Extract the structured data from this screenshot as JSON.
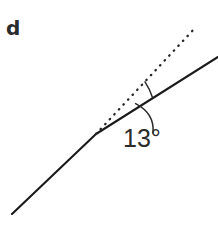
{
  "figure": {
    "panel_label": "d",
    "angle_label": "13°",
    "background_color": "#ffffff",
    "stroke_color": "#1a1a1a",
    "dotted_color": "#262626",
    "arc_color": "#2b2b2b",
    "label_color": "#2b2b2b"
  },
  "chart_data": {
    "type": "diagram",
    "title": "",
    "subtitle": "",
    "xlabel": "",
    "ylabel": "",
    "annotations": [
      {
        "name": "panel-letter",
        "text": "d",
        "x": 6,
        "y": 18
      },
      {
        "name": "angle-value",
        "text": "13°",
        "x": 123,
        "y": 126
      }
    ],
    "series": [
      {
        "name": "solid-polyline",
        "style": "solid",
        "points": [
          [
            12,
            214
          ],
          [
            96,
            134
          ],
          [
            218,
            57
          ]
        ]
      },
      {
        "name": "dotted-reference-line",
        "style": "dotted",
        "points": [
          [
            96,
            134
          ],
          [
            196,
            27
          ]
        ]
      }
    ],
    "angle_marks": [
      {
        "name": "angle-arc-small",
        "vertex": [
          96,
          134
        ],
        "value_deg": 13,
        "arc_from": [
          145,
          82
        ],
        "arc_to": [
          152,
          97
        ]
      },
      {
        "name": "angle-leader-arc",
        "arc_from": [
          136,
          104
        ],
        "arc_to": [
          152,
          133
        ]
      }
    ],
    "grid": false,
    "legend": false
  }
}
